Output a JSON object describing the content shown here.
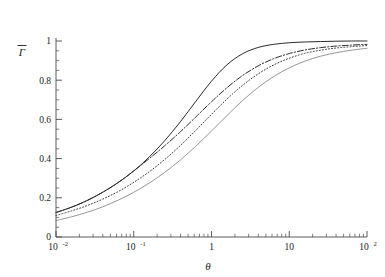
{
  "chart_data": {
    "type": "line",
    "title": "",
    "subtitle": "",
    "xlabel": "θ",
    "ylabel": "Γ̄",
    "xscale": "log",
    "yscale": "linear",
    "xlim": [
      0.01,
      100
    ],
    "ylim": [
      0,
      1
    ],
    "grid": false,
    "legend": "none",
    "x_ticks": [
      {
        "value": 0.01,
        "mantissa": "10",
        "exponent": "-2",
        "label": "10⁻²"
      },
      {
        "value": 0.1,
        "mantissa": "10",
        "exponent": "-1",
        "label": "10⁻¹"
      },
      {
        "value": 1,
        "mantissa": "1",
        "exponent": "",
        "label": "1"
      },
      {
        "value": 10,
        "mantissa": "10",
        "exponent": "",
        "label": "10"
      },
      {
        "value": 100,
        "mantissa": "10",
        "exponent": "2",
        "label": "10²"
      }
    ],
    "y_ticks": [
      {
        "value": 0,
        "label": "0"
      },
      {
        "value": 0.2,
        "label": "0.2"
      },
      {
        "value": 0.4,
        "label": "0.4"
      },
      {
        "value": 0.6,
        "label": "0.6"
      },
      {
        "value": 0.8,
        "label": "0.8"
      },
      {
        "value": 1,
        "label": "1"
      }
    ],
    "x": [
      0.01,
      0.0158,
      0.0251,
      0.0398,
      0.0631,
      0.1,
      0.158,
      0.251,
      0.398,
      0.631,
      1.0,
      1.585,
      2.512,
      3.981,
      6.31,
      10.0,
      15.85,
      25.12,
      39.81,
      63.1,
      100.0
    ],
    "series": [
      {
        "name": "curve-1",
        "style": "solid",
        "color": "#2b2b2b",
        "width": 1.0,
        "values": [
          0.125,
          0.152,
          0.186,
          0.228,
          0.278,
          0.337,
          0.408,
          0.492,
          0.588,
          0.693,
          0.795,
          0.879,
          0.935,
          0.967,
          0.983,
          0.991,
          0.995,
          0.997,
          0.999,
          1.0,
          1.0
        ]
      },
      {
        "name": "curve-2",
        "style": "dash-dot",
        "color": "#2b2b2b",
        "width": 1.0,
        "values": [
          0.125,
          0.152,
          0.186,
          0.228,
          0.278,
          0.337,
          0.4,
          0.466,
          0.537,
          0.613,
          0.69,
          0.762,
          0.824,
          0.873,
          0.91,
          0.936,
          0.954,
          0.966,
          0.974,
          0.979,
          0.983
        ]
      },
      {
        "name": "curve-3",
        "style": "dotted",
        "color": "#3a3a3a",
        "width": 1.0,
        "values": [
          0.11,
          0.133,
          0.16,
          0.193,
          0.232,
          0.279,
          0.333,
          0.396,
          0.467,
          0.545,
          0.626,
          0.704,
          0.774,
          0.832,
          0.878,
          0.912,
          0.937,
          0.953,
          0.964,
          0.971,
          0.977
        ]
      },
      {
        "name": "curve-4",
        "style": "solid",
        "color": "#8a8a8a",
        "width": 0.9,
        "values": [
          0.084,
          0.103,
          0.126,
          0.154,
          0.188,
          0.228,
          0.275,
          0.33,
          0.393,
          0.464,
          0.541,
          0.62,
          0.696,
          0.763,
          0.819,
          0.863,
          0.897,
          0.922,
          0.94,
          0.953,
          0.963
        ]
      }
    ]
  },
  "figure": {
    "background": "#ffffff",
    "axis_color": "#4a4a4a"
  }
}
